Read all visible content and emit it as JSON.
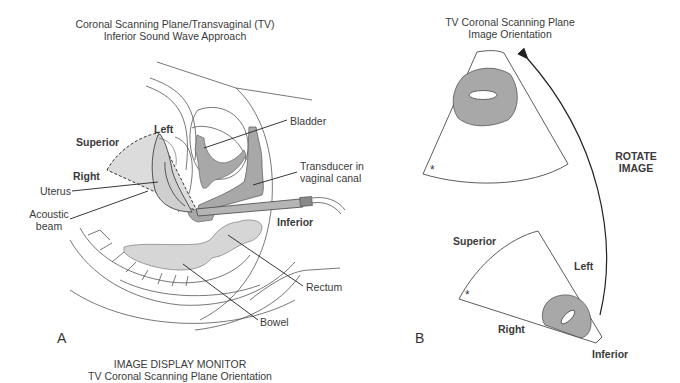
{
  "panel_a": {
    "letter": "A",
    "title_line1": "Coronal Scanning Plane/Transvaginal (TV)",
    "title_line2": "Inferior Sound Wave Approach",
    "orientation_labels": {
      "superior": "Superior",
      "left": "Left",
      "right": "Right",
      "inferior": "Inferior"
    },
    "anatomy_labels": {
      "bladder": "Bladder",
      "transducer_line1": "Transducer in",
      "transducer_line2": "vaginal canal",
      "uterus": "Uterus",
      "acoustic_line1": "Acoustic",
      "acoustic_line2": "beam",
      "rectum": "Rectum",
      "bowel": "Bowel"
    },
    "caption_line1": "IMAGE DISPLAY MONITOR",
    "caption_line2": "TV Coronal Scanning Plane Orientation"
  },
  "panel_b": {
    "letter": "B",
    "title_line1": "TV Coronal Scanning Plane",
    "title_line2": "Image Orientation",
    "rotate_line1": "ROTATE",
    "rotate_line2": "IMAGE",
    "star_marker": "*",
    "orientation_labels": {
      "superior": "Superior",
      "left": "Left",
      "right": "Right",
      "inferior": "Inferior"
    }
  },
  "colors": {
    "fill_gray": "#a8a8a8",
    "fill_light": "#d9d9d9",
    "line": "#333333"
  }
}
